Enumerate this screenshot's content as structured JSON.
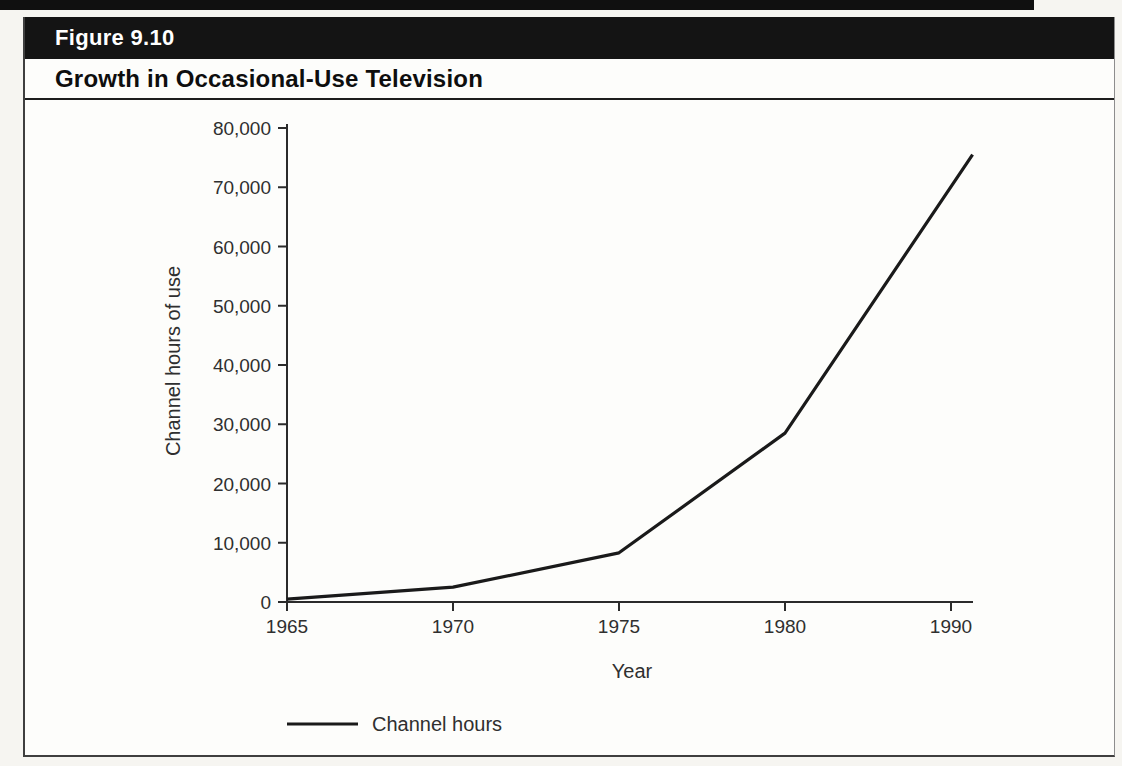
{
  "figure": {
    "label": "Figure 9.10",
    "title": "Growth in Occasional-Use Television"
  },
  "chart_data": {
    "type": "line",
    "title": "Growth in Occasional-Use Television",
    "xlabel": "Year",
    "ylabel": "Channel hours of use",
    "ylim": [
      0,
      80000
    ],
    "grid": false,
    "x_tick_labels": [
      "1965",
      "1970",
      "1975",
      "1980",
      "1990"
    ],
    "y_tick_labels": [
      "0",
      "10,000",
      "20,000",
      "30,000",
      "40,000",
      "50,000",
      "60,000",
      "70,000",
      "80,000"
    ],
    "axis_note": "x ticks equally spaced; interval 1980-1990 spans one tick unit; line extends slightly past the 1990 tick to the end of the axis",
    "series": [
      {
        "name": "Channel hours",
        "points": [
          {
            "year": 1965,
            "value": 500,
            "axis_unit": 0
          },
          {
            "year": 1970,
            "value": 2500,
            "axis_unit": 1
          },
          {
            "year": 1975,
            "value": 8300,
            "axis_unit": 2
          },
          {
            "year": 1980,
            "value": 28500,
            "axis_unit": 3
          },
          {
            "year": 1991,
            "value": 75500,
            "axis_unit": 4.13
          }
        ]
      }
    ],
    "legend": {
      "position": "bottom-left",
      "entries": [
        {
          "label": "Channel hours",
          "color": "#1a1a1a"
        }
      ]
    }
  },
  "colors": {
    "header_bar": "#141414",
    "header_text": "#ffffff",
    "frame_border": "#3f3f3f",
    "axis_ink": "#2b2b2b",
    "label_ink": "#2f2f2f",
    "line_color": "#1a1a1a",
    "page_background": "#f6f5f1",
    "panel_background": "#fdfdfb"
  }
}
